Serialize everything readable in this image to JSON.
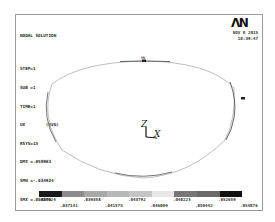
{
  "header": {
    "title": "NODAL SOLUTION",
    "lines": [
      "STEP=1",
      "SUB =1",
      "TIME=1",
      "UX        (AVG)",
      "RSYS=15",
      "DMX =.058903",
      "SMN =-.034924",
      "SMX =.054876"
    ]
  },
  "branding": {
    "logo": "ΛN",
    "date": "NOV  8 2015",
    "time": "18:39:47"
  },
  "markers": {
    "min": "MN",
    "max": "MX"
  },
  "triad": {
    "z": "Z",
    "x": "X"
  },
  "legend": {
    "colors": [
      "#1a1a1a",
      "#8c8c8c",
      "#a8a8a8",
      "#b8b8b8",
      "#c4c4c4",
      "#e8e8e8",
      "#777777",
      "#6a6a6a",
      "#111111"
    ],
    "labels": [
      ".034924",
      ".037141",
      ".039358",
      ".041575",
      ".043792",
      ".046009",
      ".048225",
      ".050442",
      ".052659",
      ".054876"
    ]
  }
}
